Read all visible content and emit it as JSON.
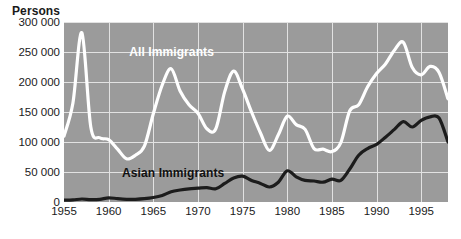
{
  "chart_data": {
    "type": "line",
    "title": "",
    "ylabel": "Persons",
    "xlabel": "",
    "ylim": [
      0,
      300000
    ],
    "xlim": [
      1955,
      1998
    ],
    "grid": true,
    "legend_position": "inline-annotation",
    "background_color": "#9b9b9b",
    "gridline_color": "#e2e2e2",
    "y_ticks": [
      {
        "value": 300000,
        "label": "300 000"
      },
      {
        "value": 250000,
        "label": "250 000"
      },
      {
        "value": 200000,
        "label": "200 000"
      },
      {
        "value": 150000,
        "label": "150 000"
      },
      {
        "value": 100000,
        "label": "100 000"
      },
      {
        "value": 50000,
        "label": "50 000"
      },
      {
        "value": 0,
        "label": "0"
      }
    ],
    "x_ticks": [
      {
        "value": 1955,
        "label": "1955"
      },
      {
        "value": 1960,
        "label": "1960"
      },
      {
        "value": 1965,
        "label": "1965"
      },
      {
        "value": 1970,
        "label": "1970"
      },
      {
        "value": 1975,
        "label": "1975"
      },
      {
        "value": 1980,
        "label": "1980"
      },
      {
        "value": 1985,
        "label": "1985"
      },
      {
        "value": 1990,
        "label": "1990"
      },
      {
        "value": 1995,
        "label": "1995"
      }
    ],
    "series": [
      {
        "name": "All Immigrants",
        "color": "#ffffff",
        "label_x": 1962.3,
        "label_y": 248000,
        "x": [
          1955,
          1956,
          1957,
          1958,
          1959,
          1960,
          1961,
          1962,
          1963,
          1964,
          1965,
          1966,
          1967,
          1968,
          1969,
          1970,
          1971,
          1972,
          1973,
          1974,
          1975,
          1976,
          1977,
          1978,
          1979,
          1980,
          1981,
          1982,
          1983,
          1984,
          1985,
          1986,
          1987,
          1988,
          1989,
          1990,
          1991,
          1992,
          1993,
          1994,
          1995,
          1996,
          1997,
          1998
        ],
        "values": [
          110000,
          165000,
          282000,
          125000,
          107000,
          104000,
          88000,
          72000,
          78000,
          93000,
          147000,
          195000,
          222000,
          185000,
          162000,
          148000,
          122000,
          122000,
          184000,
          218000,
          188000,
          150000,
          115000,
          86000,
          112000,
          143000,
          129000,
          121000,
          89000,
          88000,
          84000,
          99000,
          152000,
          162000,
          192000,
          214000,
          230000,
          253000,
          266000,
          224000,
          212000,
          226000,
          216000,
          172000
        ]
      },
      {
        "name": "Asian Immigrants",
        "color": "#1c1c1c",
        "label_x": 1961.5,
        "label_y": 46000,
        "x": [
          1955,
          1956,
          1957,
          1958,
          1959,
          1960,
          1961,
          1962,
          1963,
          1964,
          1965,
          1966,
          1967,
          1968,
          1969,
          1970,
          1971,
          1972,
          1973,
          1974,
          1975,
          1976,
          1977,
          1978,
          1979,
          1980,
          1981,
          1982,
          1983,
          1984,
          1985,
          1986,
          1987,
          1988,
          1989,
          1990,
          1991,
          1992,
          1993,
          1994,
          1995,
          1996,
          1997,
          1998
        ],
        "values": [
          3000,
          3500,
          5000,
          4000,
          4500,
          7000,
          5500,
          4500,
          4500,
          5500,
          7500,
          11000,
          17000,
          20000,
          22000,
          23000,
          24000,
          22000,
          31000,
          40000,
          43000,
          36000,
          31000,
          25000,
          33000,
          52000,
          42000,
          36000,
          35000,
          33000,
          38000,
          36000,
          55000,
          78000,
          89000,
          96000,
          108000,
          121000,
          134000,
          125000,
          136000,
          142000,
          140000,
          100000
        ]
      }
    ]
  },
  "annotations": {
    "all_immigrants_label": "All Immigrants",
    "asian_immigrants_label": "Asian Immigrants"
  }
}
